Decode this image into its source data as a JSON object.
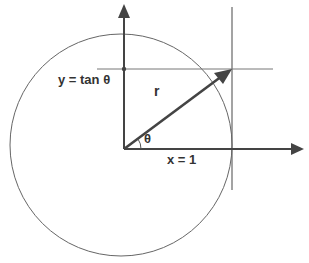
{
  "diagram": {
    "labels": {
      "y_label": "y = tan θ",
      "r_label": "r",
      "theta_label": "θ",
      "x_label": "x = 1"
    },
    "elements": {
      "circle": {
        "cx": 121,
        "cy": 145,
        "r": 111
      },
      "origin": {
        "x": 124,
        "y": 149
      },
      "x_axis_end": {
        "x": 304,
        "y": 149
      },
      "y_axis_end": {
        "x": 124,
        "y": 4
      },
      "tangent_line_x": 232,
      "tan_line_y": 69,
      "point": {
        "x": 232,
        "y": 69
      }
    },
    "colors": {
      "stroke": "#444444",
      "thin_stroke": "#777777",
      "text": "#333333",
      "background": "#ffffff"
    }
  }
}
